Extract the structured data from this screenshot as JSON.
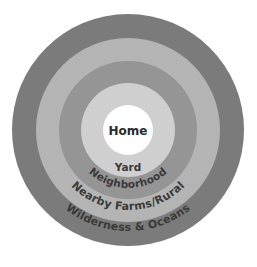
{
  "diagram": {
    "type": "concentric-circles",
    "background_color": "#ffffff",
    "center": {
      "x": 128,
      "y": 130
    },
    "text_color": "#3a3a3a",
    "center_text_color": "#2b2b2b",
    "rings": [
      {
        "index": 0,
        "label": "Wilderness & Oceans",
        "color": "#7b7b7b",
        "outer_radius": 116,
        "label_style": "curved",
        "label_radius": 101,
        "font_size": 11
      },
      {
        "index": 1,
        "label": "Nearby Farms/Rural",
        "color": "#b4b4b4",
        "outer_radius": 92,
        "label_style": "curved",
        "label_radius": 80,
        "font_size": 11
      },
      {
        "index": 2,
        "label": "Neighborhood",
        "color": "#959595",
        "outer_radius": 69,
        "label_style": "curved",
        "label_radius": 58,
        "font_size": 10.5
      },
      {
        "index": 3,
        "label": "Yard",
        "color": "#cfcfcf",
        "outer_radius": 47,
        "label_style": "flat",
        "label_y": 171,
        "font_size": 10.5
      },
      {
        "index": 4,
        "label": "Home",
        "color": "#ffffff",
        "outer_radius": 25,
        "label_style": "flat",
        "label_y": 135,
        "font_size": 12
      }
    ]
  }
}
